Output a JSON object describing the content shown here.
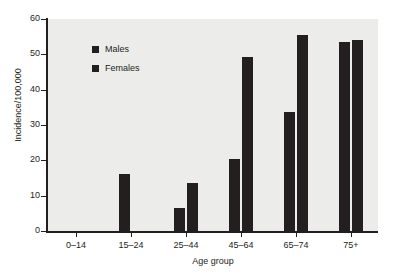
{
  "chart_data": {
    "type": "bar",
    "title": "",
    "subtitle": "",
    "xlabel": "Age group",
    "ylabel": "Incidence/100,000",
    "categories": [
      "0–14",
      "15–24",
      "25–44",
      "45–64",
      "65–74",
      "75+"
    ],
    "series": [
      {
        "name": "Males",
        "color": "#231f20",
        "values": [
          0,
          16,
          6.6,
          20.3,
          33.8,
          53.5
        ]
      },
      {
        "name": "Females",
        "color": "#231f20",
        "values": [
          0,
          0,
          13.5,
          49.3,
          55.6,
          54.0
        ]
      }
    ],
    "ylim": [
      0,
      60
    ],
    "yticks": [
      0,
      10,
      20,
      30,
      40,
      50,
      60
    ],
    "ytick_labels": [
      "0",
      "10",
      "20",
      "30",
      "40",
      "50",
      "60"
    ],
    "grid": false,
    "legend_position": "inside-top-left",
    "plot_background": "#ececeb",
    "axis_color": "#231f20",
    "figure_background": "#ffffff"
  }
}
